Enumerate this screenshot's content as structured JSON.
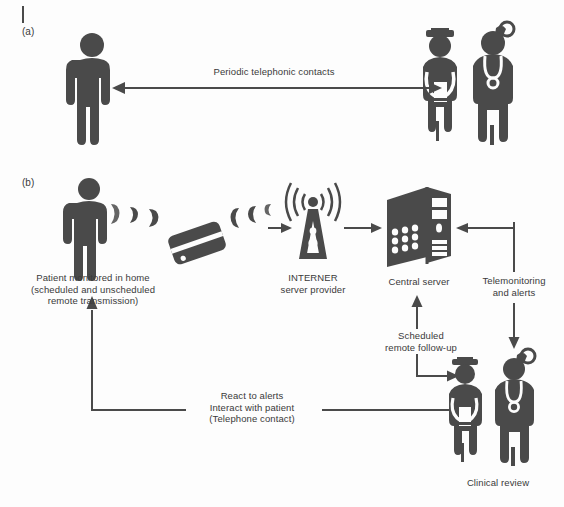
{
  "figure": {
    "type": "diagram",
    "background_color": "#fdfdfd",
    "ink_color": "#4a4a4a"
  },
  "panel_a": {
    "tag": "(a)",
    "actors": [
      {
        "name": "patient",
        "label": ""
      },
      {
        "name": "nurse",
        "label": ""
      },
      {
        "name": "physician",
        "label": ""
      }
    ],
    "arrow_label": "Periodic telephonic contacts"
  },
  "panel_b": {
    "tag": "(b)",
    "nodes": [
      {
        "name": "patient-home",
        "label": "Patient monitored in home\n(scheduled and unscheduled\nremote transmission)"
      },
      {
        "name": "transmitter-device",
        "label": ""
      },
      {
        "name": "internet-tower",
        "label": "INTERNER\nserver provider"
      },
      {
        "name": "central-server",
        "label": "Central server"
      },
      {
        "name": "clinical-team",
        "label": "Clinical review"
      }
    ],
    "edges": [
      {
        "name": "telemonitoring-and-alerts",
        "label": "Telemonitoring\nand alerts"
      },
      {
        "name": "scheduled-remote-follow-up",
        "label": "Scheduled\nremote follow-up"
      },
      {
        "name": "react-to-alerts",
        "label": "React to alerts\nInteract with patient\n(Telephone contact)"
      }
    ]
  }
}
